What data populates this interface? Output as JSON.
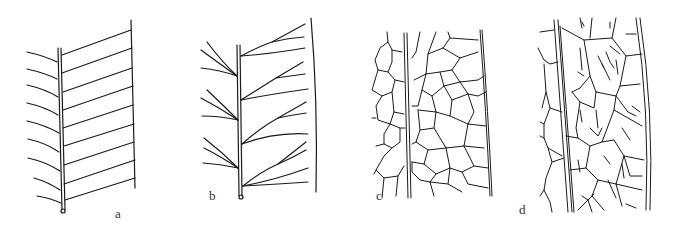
{
  "figure": {
    "panels": [
      {
        "id": "a",
        "label": "a",
        "description": "pinnate venation, simple parallel secondary veins"
      },
      {
        "id": "b",
        "label": "b",
        "description": "pinnate venation, dichotomously forking veins"
      },
      {
        "id": "c",
        "label": "c",
        "description": "reticulate venation, polygonal areoles"
      },
      {
        "id": "d",
        "label": "d",
        "description": "reticulate venation with free-ending veinlets in areoles"
      }
    ]
  },
  "colors": {
    "line": "#1a1a1a",
    "background": "#ffffff"
  }
}
